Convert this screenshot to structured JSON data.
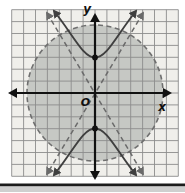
{
  "figure": {
    "labels": {
      "x_axis": "x",
      "y_axis": "y",
      "origin": "O"
    },
    "colors": {
      "grid_bg": "#f0efeb",
      "grid_line": "#8c8c8c",
      "circle_fill": "#c6c8c4",
      "circle_stroke": "#6f6f6f",
      "asymptote": "#6a6a6a",
      "hyperbola": "#3f3f3f",
      "axis": "#111111",
      "point": "#111111",
      "bottom_bar": "#1c1c1c",
      "bottom_strip": "#cfcfcf"
    },
    "geometry_px": {
      "origin": [
        95,
        93
      ],
      "cell": 11.9,
      "half_cells": 7,
      "circle_radius": 68,
      "vertex_offset": 35.5
    }
  },
  "chart_data": {
    "type": "line",
    "xlabel": "x",
    "ylabel": "y",
    "origin_label": "O",
    "xlim": [
      -7,
      7
    ],
    "ylim": [
      -7,
      7
    ],
    "grid": true,
    "legend": "none",
    "series": [
      {
        "name": "circle-boundary",
        "shape": "circle",
        "style": "dashed",
        "center": [
          0,
          0
        ],
        "radius": 6,
        "region": "interior shaded gray"
      },
      {
        "name": "hyperbola",
        "style": "solid",
        "orientation": "opens up and down",
        "vertices": [
          [
            0,
            3
          ],
          [
            0,
            -3
          ]
        ],
        "arrow_ends": true
      },
      {
        "name": "asymptote-positive",
        "style": "dashed",
        "line": "y ≈ 1.7x through origin",
        "arrow_ends": true
      },
      {
        "name": "asymptote-negative",
        "style": "dashed",
        "line": "y ≈ -1.7x through origin",
        "arrow_ends": true
      }
    ],
    "marked_points": [
      [
        0,
        3
      ],
      [
        0,
        -3
      ]
    ]
  }
}
